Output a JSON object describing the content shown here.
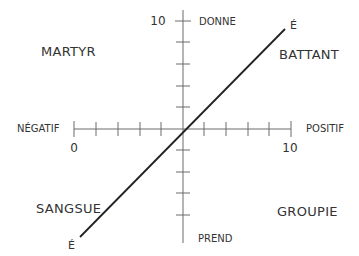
{
  "diagram": {
    "title": "",
    "vertical_axis": {
      "top_label": "DONNE",
      "bottom_label": "PREND",
      "max_label": "10"
    },
    "horizontal_axis": {
      "left_label": "NÉGATIF",
      "right_label": "POSITIF",
      "min_label": "0",
      "max_label": "10"
    },
    "quadrants": {
      "top_left": "MARTYR",
      "top_right": "BATTANT",
      "bottom_left": "SANGSUE",
      "bottom_right": "GROUPIE"
    },
    "diagonal": {
      "top_end_label": "É",
      "bottom_end_label": "É"
    },
    "colors": {
      "axis": "#6b6b6b",
      "diagonal": "#222222",
      "text": "#333333"
    }
  }
}
